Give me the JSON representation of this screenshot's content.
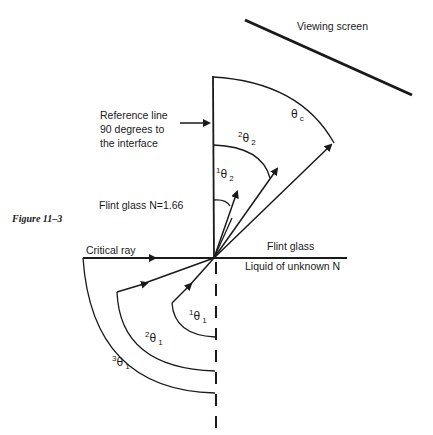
{
  "figure": {
    "caption": "Figure 11–3"
  },
  "labels": {
    "viewing_screen": "Viewing screen",
    "reference_line_1": "Reference line",
    "reference_line_2": "90 degrees to",
    "reference_line_3": "the interface",
    "flint_glass_index": "Flint glass  N=1.66",
    "critical_ray": "Critical ray",
    "flint_glass": "Flint glass",
    "liquid": "Liquid of unknown N"
  },
  "angles": {
    "theta_c": {
      "symbol": "θ",
      "sup": "",
      "sub": "c"
    },
    "theta2_2": {
      "symbol": "θ",
      "sup": "2",
      "sub": "2"
    },
    "theta1_2": {
      "symbol": "θ",
      "sup": "1",
      "sub": "2"
    },
    "theta1_1": {
      "symbol": "θ",
      "sup": "1",
      "sub": "1"
    },
    "theta2_1": {
      "symbol": "θ",
      "sup": "2",
      "sub": "1"
    },
    "theta3_1": {
      "symbol": "θ",
      "sup": "3",
      "sub": "1"
    }
  },
  "colors": {
    "ink": "#1a1a1a",
    "background": "#ffffff"
  }
}
